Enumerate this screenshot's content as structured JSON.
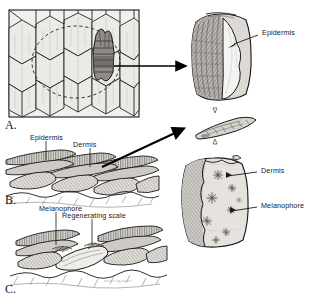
{
  "figure": {
    "ink_color": "#1a1a1a",
    "fill_light": "#e8e6e3",
    "fill_mid": "#b9b6b1",
    "fill_dark": "#6f6b66",
    "background": "#ffffff"
  },
  "panels": [
    {
      "id": "A",
      "letter": "A.",
      "caption": "Scale pattern in skin, surface view with regenerating scale"
    },
    {
      "id": "B",
      "letter": "B.",
      "caption": "Cross section of normal scaled skin"
    },
    {
      "id": "C",
      "letter": "C.",
      "caption": "Cross section of skin with regenerating scale"
    }
  ],
  "labels": {
    "epidermis_right": "Epidermis",
    "dermis_right": "Dermis",
    "melanophore_right": "Melanophore",
    "epidermis_b": "Epidermis",
    "dermis_b": "Dermis",
    "melanophore_c": "Melanophore",
    "regenerating_scale_c": "Regenerating scale"
  },
  "arrows": {
    "a_to_scale": "solid-arrow-right",
    "b_to_scale": "solid-arrow-diagonal",
    "scale_flip_top": "hollow-arrow-down",
    "scale_flip_bottom": "hollow-arrow-up"
  },
  "signature": "artist signature"
}
